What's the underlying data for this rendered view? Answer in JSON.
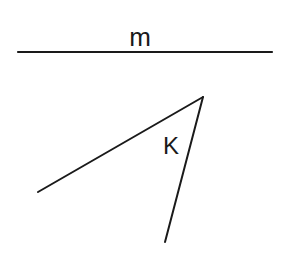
{
  "diagram": {
    "type": "geometry",
    "line": {
      "label": "m",
      "x1": 18,
      "y1": 52,
      "x2": 272,
      "y2": 52
    },
    "angle": {
      "label": "K",
      "vertex": {
        "x": 203,
        "y": 97
      },
      "ray1_end": {
        "x": 38,
        "y": 192
      },
      "ray2_end": {
        "x": 165,
        "y": 242
      }
    },
    "stroke_color": "#1a1a1a",
    "background": "#ffffff"
  }
}
